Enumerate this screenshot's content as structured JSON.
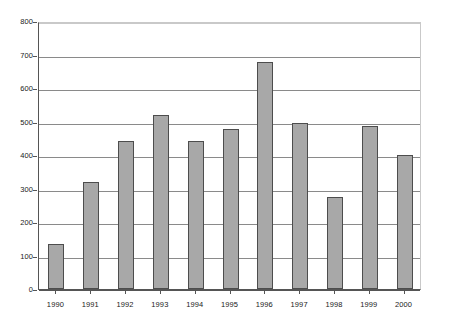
{
  "chart_data": {
    "type": "bar",
    "title": "",
    "subtitle": "",
    "xlabel": "",
    "ylabel": "",
    "categories": [
      "1990",
      "1991",
      "1992",
      "1993",
      "1994",
      "1995",
      "1996",
      "1997",
      "1998",
      "1999",
      "2000"
    ],
    "values": [
      135,
      320,
      442,
      518,
      443,
      477,
      678,
      495,
      275,
      487,
      400
    ],
    "series": [
      {
        "name": "",
        "values": [
          135,
          320,
          442,
          518,
          443,
          477,
          678,
          495,
          275,
          487,
          400
        ]
      }
    ],
    "ylim": [
      0,
      800
    ],
    "ytick_labels": [
      "0",
      "100",
      "200",
      "300",
      "400",
      "500",
      "600",
      "700",
      "800"
    ],
    "ytick_values": [
      0,
      100,
      200,
      300,
      400,
      500,
      600,
      700,
      800
    ],
    "grid": true,
    "grid_axis": "y",
    "legend": false,
    "legend_position": "none",
    "annotations": [],
    "colors": {
      "bar_fill": "#a8a8a8",
      "bar_border": "#4d4d4d",
      "gridline": "#8a8a8a",
      "axis": "#555555",
      "frame": "#c9c9c9",
      "text": "#1a1a1a",
      "background": "#ffffff"
    }
  }
}
